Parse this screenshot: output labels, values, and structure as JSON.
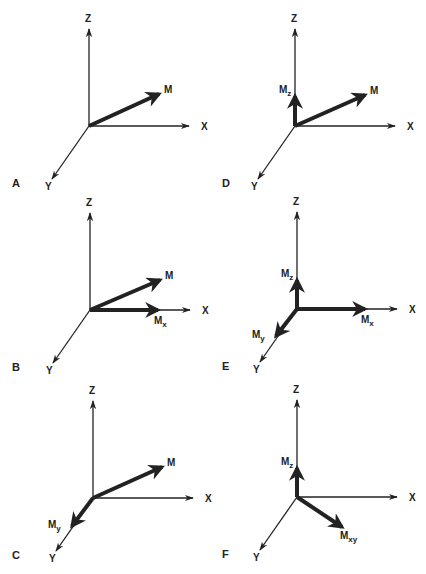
{
  "figure": {
    "panels": [
      {
        "id": "A",
        "vectors": [
          {
            "name": "M",
            "label": "M",
            "sub": "",
            "dir": [
              0.7,
              0.32
            ]
          }
        ]
      },
      {
        "id": "B",
        "vectors": [
          {
            "name": "M",
            "label": "M",
            "sub": "",
            "dir": [
              0.7,
              0.3
            ]
          },
          {
            "name": "Mx",
            "label": "M",
            "sub": "x",
            "dir": [
              0.68,
              0.0
            ]
          }
        ]
      },
      {
        "id": "C",
        "vectors": [
          {
            "name": "M",
            "label": "M",
            "sub": "",
            "dir": [
              0.69,
              0.31
            ]
          },
          {
            "name": "My",
            "label": "M",
            "sub": "y",
            "dir": [
              -0.21,
              -0.28
            ]
          }
        ]
      },
      {
        "id": "D",
        "vectors": [
          {
            "name": "Mz",
            "label": "M",
            "sub": "z",
            "dir": [
              0.0,
              0.3
            ]
          },
          {
            "name": "M",
            "label": "M",
            "sub": "",
            "dir": [
              0.7,
              0.31
            ]
          }
        ]
      },
      {
        "id": "E",
        "vectors": [
          {
            "name": "Mz",
            "label": "M",
            "sub": "z",
            "dir": [
              0.0,
              0.29
            ]
          },
          {
            "name": "Mx",
            "label": "M",
            "sub": "x",
            "dir": [
              0.68,
              0.0
            ]
          },
          {
            "name": "My",
            "label": "M",
            "sub": "y",
            "dir": [
              -0.21,
              -0.27
            ]
          }
        ]
      },
      {
        "id": "F",
        "vectors": [
          {
            "name": "Mz",
            "label": "M",
            "sub": "z",
            "dir": [
              0.0,
              0.29
            ]
          },
          {
            "name": "Mxy",
            "label": "M",
            "sub": "xy",
            "dir": [
              0.45,
              -0.3
            ]
          }
        ]
      }
    ],
    "axes": {
      "x": "X",
      "y": "Y",
      "z": "Z"
    },
    "colors": {
      "ink": "#222222",
      "background": "#ffffff"
    }
  }
}
